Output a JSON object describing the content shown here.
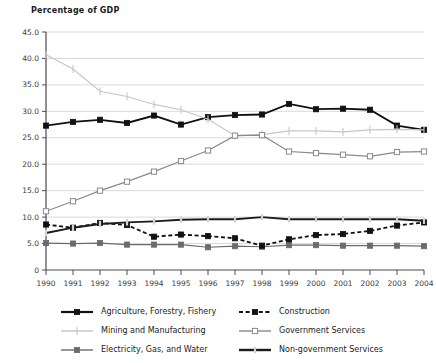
{
  "chart_data": {
    "type": "line",
    "title": "Percentage of GDP",
    "xlabel": "",
    "ylabel": "",
    "ylim": [
      0,
      45
    ],
    "ytick_labels": [
      "45.0",
      "40.0",
      "35.0",
      "30.0",
      "25.0",
      "20.0",
      "15.0",
      "10.0",
      "5.0",
      "0"
    ],
    "yticks": [
      45,
      40,
      35,
      30,
      25,
      20,
      15,
      10,
      5,
      0
    ],
    "grid": true,
    "legend_position": "bottom",
    "categories": [
      "1990",
      "1991",
      "1992",
      "1993",
      "1994",
      "1995",
      "1996",
      "1997",
      "1998",
      "1999",
      "2000",
      "2001",
      "2002",
      "2003",
      "2004"
    ],
    "series": [
      {
        "name": "Agriculture, Forestry, Fishery",
        "color": "#111111",
        "marker": "square-filled",
        "dash": "solid",
        "values": [
          27.3,
          28.0,
          28.4,
          27.8,
          29.2,
          27.5,
          28.9,
          29.3,
          29.4,
          31.4,
          30.4,
          30.5,
          30.3,
          27.3,
          26.5
        ]
      },
      {
        "name": "Mining and Manufacturing",
        "color": "#c6c6c6",
        "marker": "plus",
        "dash": "solid",
        "values": [
          40.7,
          38.0,
          33.8,
          32.8,
          31.3,
          30.3,
          28.5,
          25.4,
          25.6,
          26.3,
          26.3,
          26.1,
          26.5,
          26.6,
          26.5
        ]
      },
      {
        "name": "Electricity, Gas, and Water",
        "color": "#6b6b6b",
        "marker": "square-filled",
        "dash": "solid",
        "values": [
          5.1,
          5.0,
          5.1,
          4.8,
          4.8,
          4.8,
          4.3,
          4.5,
          4.4,
          4.7,
          4.7,
          4.6,
          4.6,
          4.6,
          4.5
        ]
      },
      {
        "name": "Construction",
        "color": "#111111",
        "marker": "square-filled",
        "dash": "dashed",
        "values": [
          8.6,
          8.0,
          8.9,
          8.5,
          6.3,
          6.7,
          6.4,
          6.0,
          4.6,
          5.8,
          6.6,
          6.8,
          7.4,
          8.4,
          9.0
        ]
      },
      {
        "name": "Government Services",
        "color": "#8a8a8a",
        "marker": "square-open",
        "dash": "solid",
        "values": [
          11.1,
          13.0,
          15.0,
          16.7,
          18.6,
          20.6,
          22.6,
          25.4,
          25.5,
          22.4,
          22.1,
          21.8,
          21.5,
          22.3,
          22.4
        ]
      },
      {
        "name": "Non-government Services",
        "color": "#1b1b1b",
        "marker": "plus-light",
        "dash": "solid",
        "values": [
          7.0,
          8.0,
          8.7,
          9.0,
          9.2,
          9.5,
          9.6,
          9.6,
          10.0,
          9.6,
          9.6,
          9.6,
          9.6,
          9.6,
          9.3
        ]
      }
    ]
  },
  "legend": {
    "items": [
      {
        "label": "Agriculture, Forestry, Fishery"
      },
      {
        "label": "Construction"
      },
      {
        "label": "Mining and Manufacturing"
      },
      {
        "label": "Government Services"
      },
      {
        "label": "Electricity, Gas, and Water"
      },
      {
        "label": "Non-government Services"
      }
    ]
  }
}
